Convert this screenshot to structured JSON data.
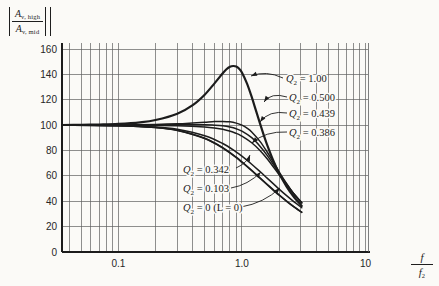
{
  "figure": {
    "background": "#fbfaf7",
    "ink": "#1c1c1c",
    "grid_color": "#5f5f5f",
    "text_color": "#262626"
  },
  "chart_data": {
    "type": "line",
    "title": "",
    "x_scale": "log",
    "grid": true,
    "xlim": [
      0.035,
      10.48
    ],
    "ylim": [
      0,
      160
    ],
    "xlabel_frac": {
      "num": "f",
      "den_base": "f",
      "den_sub": "2"
    },
    "ylabel_frac": {
      "num_base": "A",
      "num_sub": "v, high",
      "den_base": "A",
      "den_sub": "v, mid"
    },
    "x_ticks": [
      {
        "value": 0.1,
        "label": "0.1"
      },
      {
        "value": 1.0,
        "label": "1.0"
      },
      {
        "value": 10,
        "label": "10"
      }
    ],
    "y_ticks": [
      {
        "value": 160,
        "label": "160"
      },
      {
        "value": 140,
        "label": "140"
      },
      {
        "value": 120,
        "label": "120"
      },
      {
        "value": 100,
        "label": "100"
      },
      {
        "value": 80,
        "label": "80"
      },
      {
        "value": 60,
        "label": "60"
      },
      {
        "value": 40,
        "label": "40"
      },
      {
        "value": 20,
        "label": "20"
      },
      {
        "value": 0,
        "label": "0"
      }
    ],
    "x_gridlines": [
      0.04,
      0.05,
      0.06,
      0.07,
      0.08,
      0.09,
      0.1,
      0.2,
      0.3,
      0.4,
      0.5,
      0.6,
      0.7,
      0.8,
      0.9,
      1,
      2,
      3,
      4,
      5,
      6,
      7,
      8,
      9,
      10
    ],
    "y_gridlines": [
      0,
      20,
      40,
      60,
      80,
      100,
      120,
      140,
      160
    ],
    "series": [
      {
        "name": "Q2 = 1.00",
        "q2": "1.00",
        "width": 2.2,
        "points": [
          [
            0.035,
            100.1
          ],
          [
            0.05,
            100.2
          ],
          [
            0.07,
            100.5
          ],
          [
            0.1,
            101
          ],
          [
            0.15,
            102.2
          ],
          [
            0.2,
            104
          ],
          [
            0.3,
            109
          ],
          [
            0.4,
            115.8
          ],
          [
            0.5,
            124
          ],
          [
            0.6,
            132.9
          ],
          [
            0.7,
            140.9
          ],
          [
            0.75,
            144
          ],
          [
            0.8,
            146
          ],
          [
            0.85,
            146.6
          ],
          [
            0.9,
            146.2
          ],
          [
            0.95,
            144.4
          ],
          [
            1.0,
            141.4
          ],
          [
            1.1,
            132.7
          ],
          [
            1.2,
            122.2
          ],
          [
            1.3,
            111.4
          ],
          [
            1.4,
            101.4
          ],
          [
            1.5,
            92.3
          ],
          [
            1.6,
            84.4
          ],
          [
            1.8,
            71.7
          ],
          [
            2.0,
            62
          ],
          [
            2.3,
            51.5
          ],
          [
            2.6,
            44.1
          ],
          [
            3.05,
            36.3
          ]
        ]
      },
      {
        "name": "Q2 = 0.500",
        "q2": "0.500",
        "width": 1.5,
        "points": [
          [
            0.035,
            100
          ],
          [
            0.1,
            100.1
          ],
          [
            0.2,
            100.5
          ],
          [
            0.3,
            101
          ],
          [
            0.4,
            101.7
          ],
          [
            0.5,
            102.3
          ],
          [
            0.6,
            102.8
          ],
          [
            0.7,
            102.9
          ],
          [
            0.8,
            102.6
          ],
          [
            0.9,
            101.6
          ],
          [
            1.0,
            100
          ],
          [
            1.1,
            97.6
          ],
          [
            1.2,
            94.6
          ],
          [
            1.4,
            87.2
          ],
          [
            1.6,
            78.8
          ],
          [
            1.8,
            70.7
          ],
          [
            2.0,
            63.2
          ],
          [
            2.3,
            53.9
          ],
          [
            2.6,
            46.5
          ],
          [
            3.05,
            38.6
          ]
        ]
      },
      {
        "name": "Q2 = 0.439",
        "q2": "0.439",
        "width": 1.5,
        "points": [
          [
            0.035,
            100
          ],
          [
            0.1,
            100
          ],
          [
            0.3,
            100.2
          ],
          [
            0.5,
            100.3
          ],
          [
            0.6,
            100
          ],
          [
            0.7,
            99.5
          ],
          [
            0.8,
            98.5
          ],
          [
            0.9,
            97.1
          ],
          [
            1.0,
            95.2
          ],
          [
            1.2,
            90.1
          ],
          [
            1.4,
            83.4
          ],
          [
            1.6,
            76.2
          ],
          [
            1.8,
            68.9
          ],
          [
            2.0,
            62.2
          ],
          [
            2.3,
            53.6
          ],
          [
            2.6,
            46.5
          ],
          [
            3.05,
            38.8
          ]
        ]
      },
      {
        "name": "Q2 = 0.386",
        "q2": "0.386",
        "width": 1.5,
        "points": [
          [
            0.035,
            100
          ],
          [
            0.1,
            99.9
          ],
          [
            0.3,
            99.6
          ],
          [
            0.5,
            98.6
          ],
          [
            0.7,
            96.7
          ],
          [
            0.9,
            93.5
          ],
          [
            1.0,
            91.3
          ],
          [
            1.2,
            86.1
          ],
          [
            1.4,
            80
          ],
          [
            1.6,
            73.5
          ],
          [
            1.8,
            67
          ],
          [
            2.0,
            60.9
          ],
          [
            2.3,
            53
          ],
          [
            2.6,
            46.3
          ],
          [
            3.05,
            38.8
          ]
        ]
      },
      {
        "name": "Q2 = 0.342",
        "q2": "0.342",
        "width": 1.5,
        "points": [
          [
            0.035,
            100
          ],
          [
            0.1,
            99.6
          ],
          [
            0.2,
            98.6
          ],
          [
            0.3,
            96.8
          ],
          [
            0.5,
            91.7
          ],
          [
            0.7,
            85.5
          ],
          [
            0.9,
            78.8
          ],
          [
            1.0,
            75.5
          ],
          [
            1.2,
            69.2
          ],
          [
            1.4,
            63.4
          ],
          [
            1.6,
            58.2
          ],
          [
            1.8,
            53.7
          ],
          [
            2.0,
            49.6
          ],
          [
            2.3,
            44.4
          ],
          [
            2.6,
            40.1
          ],
          [
            3.05,
            34.9
          ]
        ]
      },
      {
        "name": "Q2 = 0.103",
        "q2": "0.103",
        "width": 1.5,
        "points": [
          [
            0.035,
            100
          ],
          [
            0.1,
            99.5
          ],
          [
            0.2,
            98.1
          ],
          [
            0.3,
            95.9
          ],
          [
            0.5,
            89.6
          ],
          [
            0.7,
            82.2
          ],
          [
            0.9,
            74.7
          ],
          [
            1.0,
            71.1
          ],
          [
            1.2,
            64.4
          ],
          [
            1.4,
            58.5
          ],
          [
            1.6,
            53.4
          ],
          [
            1.8,
            49
          ],
          [
            2.0,
            45.1
          ],
          [
            2.3,
            40.2
          ],
          [
            2.6,
            36.2
          ],
          [
            3.05,
            31.4
          ]
        ]
      },
      {
        "name": "Q2 = 0 (L = 0)",
        "q2": "0 (L = 0)",
        "width": 1.5,
        "points": [
          [
            0.035,
            99.9
          ],
          [
            0.1,
            99.5
          ],
          [
            0.2,
            98.1
          ],
          [
            0.3,
            95.8
          ],
          [
            0.5,
            89.4
          ],
          [
            0.7,
            81.9
          ],
          [
            0.9,
            74.3
          ],
          [
            1.0,
            70.7
          ],
          [
            1.2,
            64
          ],
          [
            1.4,
            58.1
          ],
          [
            1.6,
            53
          ],
          [
            1.8,
            48.6
          ],
          [
            2.0,
            44.7
          ],
          [
            2.3,
            39.9
          ],
          [
            2.6,
            35.9
          ],
          [
            3.05,
            31.2
          ]
        ]
      }
    ],
    "annotations": [
      {
        "base": "Q",
        "sub": "2",
        "rest": " = 1.00",
        "tx": 286,
        "ty": 82,
        "ax": 283,
        "ay": 78,
        "cx": 266,
        "cy": 70,
        "hx": 251,
        "hy": 76
      },
      {
        "base": "Q",
        "sub": "2",
        "rest": " = 0.500",
        "tx": 289,
        "ty": 101,
        "ax": 287,
        "ay": 97,
        "cx": 271,
        "cy": 92,
        "hx": 264,
        "hy": 102
      },
      {
        "base": "Q",
        "sub": "2",
        "rest": " = 0.439",
        "tx": 289,
        "ty": 117,
        "ax": 287,
        "ay": 113,
        "cx": 269,
        "cy": 110,
        "hx": 260,
        "hy": 122
      },
      {
        "base": "Q",
        "sub": "2",
        "rest": " = 0.386",
        "tx": 289,
        "ty": 136,
        "ax": 287,
        "ay": 132,
        "cx": 265,
        "cy": 131,
        "hx": 252,
        "hy": 143
      },
      {
        "base": "Q",
        "sub": "2",
        "rest": " = 0.342",
        "tx": 183,
        "ty": 173,
        "ax": 236,
        "ay": 168,
        "cx": 247,
        "cy": 163,
        "hx": 250,
        "hy": 155
      },
      {
        "base": "Q",
        "sub": "2",
        "rest": " = 0.103",
        "tx": 183,
        "ty": 192,
        "ax": 231,
        "ay": 188,
        "cx": 248,
        "cy": 185,
        "hx": 261,
        "hy": 172
      },
      {
        "base": "Q",
        "sub": "2",
        "rest": " = 0 (L = 0)",
        "tx": 183,
        "ty": 211,
        "ax": 241,
        "ay": 207,
        "cx": 264,
        "cy": 203,
        "hx": 280,
        "hy": 188
      }
    ]
  }
}
